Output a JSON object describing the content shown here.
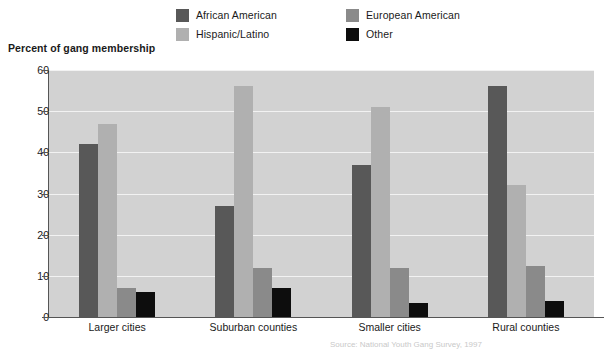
{
  "chart_data": {
    "type": "bar",
    "title": "Percent of gang membership",
    "xlabel": "",
    "ylabel": "Percent of gang membership",
    "ylim": [
      0,
      60
    ],
    "ytick_values": [
      0,
      10,
      20,
      30,
      40,
      50,
      60
    ],
    "ytick_labels": [
      "0",
      "10",
      "20",
      "30",
      "40",
      "50",
      "60"
    ],
    "grid": true,
    "legend_position": "top",
    "categories": [
      "Larger cities",
      "Suburban counties",
      "Smaller cities",
      "Rural counties"
    ],
    "series": [
      {
        "name": "African American",
        "color": "#585858",
        "values": [
          42,
          27,
          37,
          56
        ]
      },
      {
        "name": "Hispanic/Latino",
        "color": "#b0b0b0",
        "values": [
          47,
          56,
          51,
          32
        ]
      },
      {
        "name": "European American",
        "color": "#8a8a8a",
        "values": [
          7,
          12,
          12,
          12.5
        ]
      },
      {
        "name": "Other",
        "color": "#0d0d0d",
        "values": [
          6,
          7,
          3.5,
          4
        ]
      }
    ],
    "plot_background": "#d2d2d2",
    "gridline_color": "#f2f2f2",
    "axis_color": "#555555"
  },
  "legend": {
    "items": [
      {
        "label": "African American",
        "color": "#585858"
      },
      {
        "label": "European American",
        "color": "#8a8a8a"
      },
      {
        "label": "Hispanic/Latino",
        "color": "#b0b0b0"
      },
      {
        "label": "Other",
        "color": "#0d0d0d"
      }
    ]
  },
  "footnote": "Source: National Youth Gang Survey, 1997"
}
